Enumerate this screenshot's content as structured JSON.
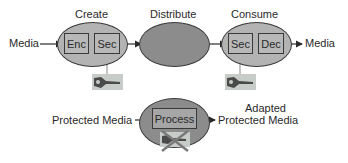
{
  "colors": {
    "light_ellipse": "#b3b3b3",
    "dark_ellipse": "#8c8c8c",
    "stroke": "#3a3a3a",
    "key_bg": "#c8ccc8",
    "cross": "#7a7a7a"
  },
  "top_flow": {
    "input_label": "Media",
    "output_label": "Media",
    "stages": [
      {
        "title": "Create",
        "boxes": [
          "Enc",
          "Sec"
        ],
        "key_icon": "key-icon"
      },
      {
        "title": "Distribute",
        "boxes": []
      },
      {
        "title": "Consume",
        "boxes": [
          "Sec",
          "Dec"
        ],
        "key_icon": "key-icon"
      }
    ]
  },
  "bottom_flow": {
    "input_label": "Protected Media",
    "process_label": "Process",
    "output_label_line1": "Adapted",
    "output_label_line2": "Protected Media",
    "key_icon": "crossed-key-icon"
  }
}
